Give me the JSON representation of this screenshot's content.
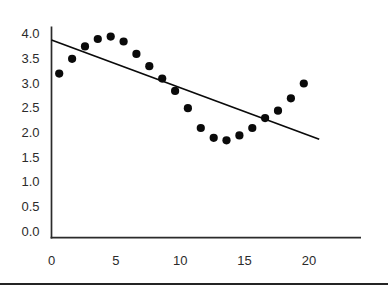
{
  "chart_data": {
    "type": "scatter",
    "title": "",
    "xlabel": "",
    "ylabel": "",
    "x": [
      0.6,
      1.6,
      2.6,
      3.6,
      4.6,
      5.6,
      6.6,
      7.6,
      8.6,
      9.6,
      10.6,
      11.6,
      12.6,
      13.6,
      14.6,
      15.6,
      16.6,
      17.6,
      18.6,
      19.6
    ],
    "y": [
      3.2,
      3.5,
      3.75,
      3.9,
      3.95,
      3.85,
      3.6,
      3.35,
      3.1,
      2.85,
      2.5,
      2.1,
      1.9,
      1.85,
      1.95,
      2.1,
      2.3,
      2.45,
      2.7,
      3.0
    ],
    "trendline": {
      "x1": 0,
      "y1": 3.88,
      "x2": 20.8,
      "y2": 1.87
    },
    "x_ticks": [
      "0",
      "5",
      "10",
      "15",
      "20"
    ],
    "y_ticks": [
      "4.0",
      "3.5",
      "3.0",
      "2.5",
      "2.0",
      "1.5",
      "1.0",
      "0.5",
      "0.0"
    ],
    "xlim": [
      0,
      24
    ],
    "ylim": [
      0,
      4.3
    ],
    "grid": false,
    "legend": null,
    "point_color": "#0a0a0a",
    "trend_color": "#0a0a0a",
    "axis_color": "#2b2b2b",
    "label_color": "#2b2b2b"
  },
  "page": {
    "bottom_rule_color": "#242424"
  }
}
